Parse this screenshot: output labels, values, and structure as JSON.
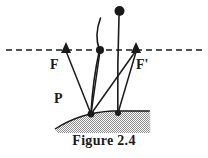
{
  "figure": {
    "caption": "Figure 2.4",
    "labels": {
      "focus_left": "F",
      "focus_right": "F'",
      "point_p": "P"
    },
    "colors": {
      "ink": "#1a1a1a",
      "ground_fill": "#9a9a9a",
      "background": "#ffffff"
    },
    "geometry": {
      "axis": {
        "name": "optical-axis",
        "style": "dashed",
        "y": 50,
        "x_start": 6,
        "x_end": 202
      },
      "markers": [
        {
          "name": "focal-point-left",
          "shape": "triangle",
          "x": 66,
          "y": 50
        },
        {
          "name": "axis-center-dot",
          "shape": "dot",
          "x": 100,
          "y": 50
        },
        {
          "name": "focal-point-right",
          "shape": "triangle",
          "x": 136,
          "y": 50
        },
        {
          "name": "object-tip-dot",
          "shape": "dot",
          "x": 120,
          "y": 10
        },
        {
          "name": "ground-contact-left",
          "shape": "dot",
          "x": 91,
          "y": 114
        },
        {
          "name": "ground-contact-right",
          "shape": "dot",
          "x": 118,
          "y": 113
        }
      ],
      "rays": [
        {
          "name": "ray-F-to-P",
          "from": [
            66,
            50
          ],
          "to": [
            91,
            114
          ]
        },
        {
          "name": "ray-center-to-P",
          "from": [
            100,
            50
          ],
          "to": [
            91,
            114
          ]
        },
        {
          "name": "ray-Fprime-to-P",
          "from": [
            136,
            50
          ],
          "to": [
            91,
            114
          ]
        },
        {
          "name": "ray-Fprime-to-right-contact",
          "from": [
            136,
            50
          ],
          "to": [
            118,
            113
          ]
        }
      ],
      "curves": [
        {
          "name": "curve-left-lens-edge",
          "start": [
            100,
            18
          ],
          "end": [
            91,
            114
          ]
        },
        {
          "name": "curve-right-object",
          "start": [
            120,
            14
          ],
          "end": [
            118,
            113
          ]
        }
      ],
      "ground": {
        "name": "hatched-ground-surface",
        "fill": "stipple",
        "x_start": 55,
        "x_end": 150,
        "y_top": 112,
        "y_bottom": 133
      }
    }
  }
}
